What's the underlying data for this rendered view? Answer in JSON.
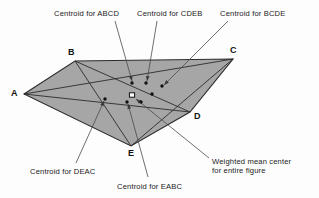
{
  "figure": {
    "type": "geometry-diagram",
    "colors": {
      "fill": "#a6a6a6",
      "stroke": "#2b2b2b",
      "background": "#fdfdfd",
      "text": "#1a1a1a",
      "marker": "#111111"
    }
  },
  "vertices": [
    {
      "id": "A",
      "label": "A",
      "x": 24,
      "y": 94,
      "label_x": 11,
      "label_y": 88
    },
    {
      "id": "B",
      "label": "B",
      "x": 75,
      "y": 61,
      "label_x": 68,
      "label_y": 47
    },
    {
      "id": "C",
      "label": "C",
      "x": 233,
      "y": 59,
      "label_x": 230,
      "label_y": 45
    },
    {
      "id": "D",
      "label": "D",
      "x": 190,
      "y": 112,
      "label_x": 194,
      "label_y": 111
    },
    {
      "id": "E",
      "label": "E",
      "x": 131,
      "y": 146,
      "label_x": 128,
      "label_y": 148
    }
  ],
  "diagonals": [
    {
      "from": "A",
      "to": "C"
    },
    {
      "from": "A",
      "to": "D"
    },
    {
      "from": "B",
      "to": "D"
    },
    {
      "from": "B",
      "to": "E"
    },
    {
      "from": "C",
      "to": "E"
    }
  ],
  "markers": [
    {
      "id": "centroid-abcd",
      "shape": "dot",
      "x": 132,
      "y": 83
    },
    {
      "id": "centroid-cdeb",
      "shape": "dot",
      "x": 146,
      "y": 83
    },
    {
      "id": "centroid-bcde",
      "shape": "dot",
      "x": 162,
      "y": 86
    },
    {
      "id": "marker-extra-1",
      "shape": "dot",
      "x": 152,
      "y": 94
    },
    {
      "id": "weighted-mean",
      "shape": "square",
      "x": 132,
      "y": 95
    },
    {
      "id": "centroid-deac",
      "shape": "dot",
      "x": 105,
      "y": 99
    },
    {
      "id": "centroid-eabc",
      "shape": "dot",
      "x": 127,
      "y": 102
    },
    {
      "id": "marker-extra-2",
      "shape": "dot",
      "x": 141,
      "y": 102
    }
  ],
  "callouts": [
    {
      "id": "centroid-abcd",
      "text": "Centroid for ABCD",
      "label_x": 54,
      "label_y": 9,
      "leader": {
        "x1": 115,
        "y1": 21,
        "x2": 132,
        "y2": 81
      }
    },
    {
      "id": "centroid-cdeb",
      "text": "Centroid for CDEB",
      "label_x": 137,
      "label_y": 9,
      "leader": {
        "x1": 157,
        "y1": 21,
        "x2": 147,
        "y2": 81
      }
    },
    {
      "id": "centroid-bcde",
      "text": "Centroid for BCDE",
      "label_x": 220,
      "label_y": 9,
      "leader": {
        "x1": 228,
        "y1": 21,
        "x2": 164,
        "y2": 85
      }
    },
    {
      "id": "centroid-deac",
      "text": "Centroid for DEAC",
      "label_x": 30,
      "label_y": 167,
      "leader": {
        "x1": 76,
        "y1": 163,
        "x2": 104,
        "y2": 101
      }
    },
    {
      "id": "centroid-eabc",
      "text": "Centroid for EABC",
      "label_x": 117,
      "label_y": 182,
      "leader": {
        "x1": 148,
        "y1": 177,
        "x2": 128,
        "y2": 104
      }
    },
    {
      "id": "weighted-mean",
      "text": "Weighted mean center\nfor entire figure",
      "line1": "Weighted mean center",
      "line2": "for entire figure",
      "label_x": 212,
      "label_y": 157,
      "leader": {
        "x1": 209,
        "y1": 158,
        "x2": 136,
        "y2": 99
      }
    }
  ]
}
